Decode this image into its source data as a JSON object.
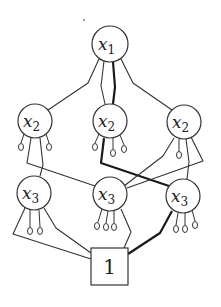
{
  "diagram": {
    "title": "",
    "nodes": [
      {
        "id": "x1",
        "var": "x",
        "sub": "1",
        "cx": 110,
        "cy": 44,
        "r": 18
      },
      {
        "id": "x2a",
        "var": "x",
        "sub": "2",
        "cx": 35,
        "cy": 121,
        "r": 17
      },
      {
        "id": "x2b",
        "var": "x",
        "sub": "2",
        "cx": 110,
        "cy": 121,
        "r": 17
      },
      {
        "id": "x2c",
        "var": "x",
        "sub": "2",
        "cx": 184,
        "cy": 122,
        "r": 17
      },
      {
        "id": "x3a",
        "var": "x",
        "sub": "3",
        "cx": 34,
        "cy": 193,
        "r": 17
      },
      {
        "id": "x3b",
        "var": "x",
        "sub": "3",
        "cx": 110,
        "cy": 194,
        "r": 17
      },
      {
        "id": "x3c",
        "var": "x",
        "sub": "3",
        "cx": 183,
        "cy": 196,
        "r": 17
      }
    ],
    "terminal": {
      "id": "one",
      "label": "1",
      "x": 91,
      "y": 248,
      "w": 37,
      "h": 37
    },
    "edges": [
      {
        "from": "x1",
        "to": "x2a",
        "thick": false
      },
      {
        "from": "x1",
        "to": "x2b",
        "thick": false
      },
      {
        "from": "x1",
        "to": "x2b",
        "thick": true
      },
      {
        "from": "x1",
        "to": "x2c",
        "thick": false
      },
      {
        "from": "x2a",
        "to": "x3a",
        "thick": false
      },
      {
        "from": "x2a",
        "to": "x3b",
        "thick": false
      },
      {
        "from": "x2b",
        "to": "x3c",
        "thick": true
      },
      {
        "from": "x2c",
        "to": "x3b",
        "thick": false
      },
      {
        "from": "x2c",
        "to": "x3b",
        "thick": false
      },
      {
        "from": "x2c",
        "to": "x3c",
        "thick": false
      },
      {
        "from": "x3a",
        "to": "one",
        "thick": false
      },
      {
        "from": "x3a",
        "to": "one",
        "thick": false
      },
      {
        "from": "x3b",
        "to": "one",
        "thick": false
      },
      {
        "from": "x3c",
        "to": "one",
        "thick": true
      }
    ],
    "leaf_counts": {
      "x2a": 2,
      "x2b": 3,
      "x2c": 1,
      "x3a": 2,
      "x3b": 3,
      "x3c": 3
    }
  }
}
